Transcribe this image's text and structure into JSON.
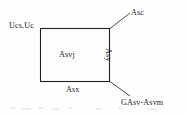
{
  "figure": {
    "type": "line-diagram",
    "background_color": "#fefefe",
    "stroke_color": "#222222",
    "text_color": "#222222",
    "rect": {
      "x": 40,
      "y": 28,
      "width": 70,
      "height": 54
    },
    "labels": {
      "top_left": "Ucs,Uc",
      "top_right": "Asc",
      "center": "Asvj",
      "right_vertical": "Asy",
      "bottom": "Asx",
      "bottom_right": "GAsv-Asvm"
    },
    "leader_lines": [
      {
        "name": "asc-leader",
        "from": [
          110,
          28
        ],
        "to": [
          130,
          13
        ]
      },
      {
        "name": "gasv-leader",
        "from": [
          110,
          82
        ],
        "to": [
          130,
          96
        ]
      }
    ]
  }
}
